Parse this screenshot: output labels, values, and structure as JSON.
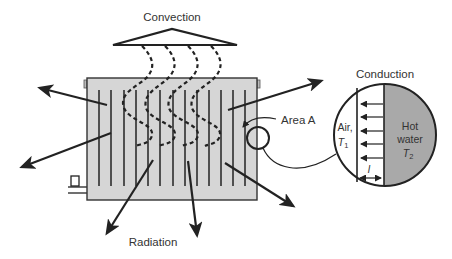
{
  "diagram": {
    "type": "heat-transfer-illustration",
    "labels": {
      "convection": "Convection",
      "radiation": "Radiation",
      "conduction": "Conduction",
      "area": "Area A",
      "air_line1": "Air,",
      "air_var": "T",
      "air_sub": "1",
      "hot_line1": "Hot",
      "hot_line2": "water",
      "hot_var": "T",
      "hot_sub": "2",
      "thickness": "l"
    },
    "colors": {
      "radiator_fill": "#d6d6d6",
      "hot_water_fill": "#a9a9a9",
      "stroke": "#222222",
      "text": "#333333"
    },
    "radiation_arrow_count": 6,
    "convection_wave_count": 4,
    "conduction_arrow_count": 5,
    "radiator_fin_count": 13
  }
}
